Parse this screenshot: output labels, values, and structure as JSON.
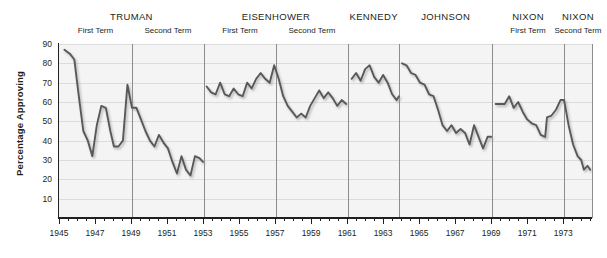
{
  "chart_data": {
    "type": "line",
    "title": "",
    "xlabel": "",
    "ylabel": "Percentage Approving",
    "ylim": [
      0,
      90
    ],
    "xlim": [
      1945,
      1974.6
    ],
    "grid": true,
    "legend": false,
    "ytick_labels": [
      "10",
      "20",
      "30",
      "40",
      "50",
      "60",
      "70",
      "80",
      "90"
    ],
    "ytick_values": [
      10,
      20,
      30,
      40,
      50,
      60,
      70,
      80,
      90
    ],
    "xtick_labels": [
      "1945",
      "1947",
      "1949",
      "1951",
      "1953",
      "1955",
      "1957",
      "1959",
      "1961",
      "1963",
      "1965",
      "1967",
      "1969",
      "1971",
      "1973"
    ],
    "xtick_values": [
      1945,
      1947,
      1949,
      1951,
      1953,
      1955,
      1957,
      1959,
      1961,
      1963,
      1965,
      1967,
      1969,
      1971,
      1973
    ],
    "presidents": [
      {
        "name": "TRUMAN",
        "start": 1945.0,
        "end": 1953.05,
        "terms": [
          {
            "label": "First Term",
            "start": 1945.0,
            "end": 1949.05
          },
          {
            "label": "Second Term",
            "start": 1949.05,
            "end": 1953.05
          }
        ]
      },
      {
        "name": "EISENHOWER",
        "start": 1953.05,
        "end": 1961.05,
        "terms": [
          {
            "label": "First Term",
            "start": 1953.05,
            "end": 1957.05
          },
          {
            "label": "Second Term",
            "start": 1957.05,
            "end": 1961.05
          }
        ]
      },
      {
        "name": "KENNEDY",
        "start": 1961.05,
        "end": 1963.9,
        "terms": []
      },
      {
        "name": "JOHNSON",
        "start": 1963.9,
        "end": 1969.05,
        "terms": []
      },
      {
        "name": "NIXON",
        "start": 1969.05,
        "end": 1973.05,
        "terms": [
          {
            "label": "First Term",
            "start": 1969.05,
            "end": 1973.05
          }
        ]
      },
      {
        "name": "NIXON",
        "start": 1973.05,
        "end": 1974.6,
        "terms": [
          {
            "label": "Second Term",
            "start": 1973.05,
            "end": 1974.6
          }
        ]
      }
    ],
    "term_dividers": [
      1949.05,
      1953.05,
      1957.05,
      1961.05,
      1963.9,
      1969.05,
      1973.05,
      1974.6
    ],
    "line_color": "#595959",
    "series": [
      {
        "name": "Truman",
        "points": [
          [
            1945.3,
            87
          ],
          [
            1945.6,
            85
          ],
          [
            1945.85,
            82
          ],
          [
            1946.1,
            63
          ],
          [
            1946.35,
            45
          ],
          [
            1946.6,
            40
          ],
          [
            1946.85,
            32
          ],
          [
            1947.1,
            48
          ],
          [
            1947.35,
            58
          ],
          [
            1947.6,
            57
          ],
          [
            1947.85,
            45
          ],
          [
            1948.05,
            37
          ],
          [
            1948.3,
            37
          ],
          [
            1948.55,
            40
          ],
          [
            1948.8,
            69
          ],
          [
            1949.05,
            57
          ],
          [
            1949.3,
            57
          ],
          [
            1949.55,
            51
          ],
          [
            1949.8,
            45
          ],
          [
            1950.05,
            40
          ],
          [
            1950.3,
            37
          ],
          [
            1950.55,
            43
          ],
          [
            1950.8,
            39
          ],
          [
            1951.05,
            36
          ],
          [
            1951.3,
            29
          ],
          [
            1951.55,
            23
          ],
          [
            1951.8,
            32
          ],
          [
            1952.05,
            25
          ],
          [
            1952.3,
            22
          ],
          [
            1952.55,
            32
          ],
          [
            1952.8,
            31
          ],
          [
            1953.0,
            29
          ]
        ]
      },
      {
        "name": "Eisenhower",
        "points": [
          [
            1953.2,
            68
          ],
          [
            1953.45,
            65
          ],
          [
            1953.7,
            64
          ],
          [
            1953.95,
            70
          ],
          [
            1954.2,
            64
          ],
          [
            1954.45,
            63
          ],
          [
            1954.7,
            67
          ],
          [
            1954.95,
            64
          ],
          [
            1955.2,
            63
          ],
          [
            1955.45,
            70
          ],
          [
            1955.7,
            67
          ],
          [
            1955.95,
            72
          ],
          [
            1956.2,
            75
          ],
          [
            1956.45,
            72
          ],
          [
            1956.7,
            70
          ],
          [
            1956.95,
            79
          ],
          [
            1957.2,
            72
          ],
          [
            1957.45,
            63
          ],
          [
            1957.7,
            58
          ],
          [
            1957.95,
            55
          ],
          [
            1958.2,
            52
          ],
          [
            1958.45,
            54
          ],
          [
            1958.7,
            52
          ],
          [
            1958.95,
            58
          ],
          [
            1959.2,
            62
          ],
          [
            1959.45,
            66
          ],
          [
            1959.7,
            62
          ],
          [
            1959.95,
            65
          ],
          [
            1960.2,
            62
          ],
          [
            1960.45,
            58
          ],
          [
            1960.7,
            61
          ],
          [
            1960.95,
            59
          ]
        ]
      },
      {
        "name": "Kennedy",
        "points": [
          [
            1961.25,
            72
          ],
          [
            1961.5,
            75
          ],
          [
            1961.75,
            71
          ],
          [
            1962.0,
            77
          ],
          [
            1962.25,
            79
          ],
          [
            1962.5,
            73
          ],
          [
            1962.75,
            70
          ],
          [
            1963.0,
            74
          ],
          [
            1963.25,
            70
          ],
          [
            1963.5,
            64
          ],
          [
            1963.75,
            61
          ],
          [
            1963.88,
            63
          ]
        ]
      },
      {
        "name": "Johnson",
        "points": [
          [
            1964.05,
            80
          ],
          [
            1964.3,
            79
          ],
          [
            1964.55,
            75
          ],
          [
            1964.8,
            74
          ],
          [
            1965.05,
            70
          ],
          [
            1965.3,
            69
          ],
          [
            1965.55,
            64
          ],
          [
            1965.8,
            63
          ],
          [
            1966.05,
            56
          ],
          [
            1966.3,
            48
          ],
          [
            1966.55,
            45
          ],
          [
            1966.8,
            48
          ],
          [
            1967.05,
            44
          ],
          [
            1967.3,
            46
          ],
          [
            1967.55,
            44
          ],
          [
            1967.8,
            38
          ],
          [
            1968.05,
            48
          ],
          [
            1968.3,
            42
          ],
          [
            1968.55,
            36
          ],
          [
            1968.8,
            42
          ],
          [
            1969.0,
            42
          ]
        ]
      },
      {
        "name": "Nixon first term",
        "points": [
          [
            1969.25,
            59
          ],
          [
            1969.5,
            59
          ],
          [
            1969.75,
            59
          ],
          [
            1970.0,
            63
          ],
          [
            1970.25,
            57
          ],
          [
            1970.5,
            60
          ],
          [
            1970.75,
            55
          ],
          [
            1971.0,
            51
          ],
          [
            1971.25,
            49
          ],
          [
            1971.5,
            48
          ],
          [
            1971.75,
            43
          ],
          [
            1972.0,
            42
          ],
          [
            1972.1,
            52
          ],
          [
            1972.35,
            53
          ],
          [
            1972.6,
            56
          ],
          [
            1972.85,
            61
          ],
          [
            1973.0,
            61
          ]
        ]
      },
      {
        "name": "Nixon second term",
        "points": [
          [
            1973.05,
            61
          ],
          [
            1973.3,
            48
          ],
          [
            1973.55,
            38
          ],
          [
            1973.8,
            32
          ],
          [
            1974.0,
            30
          ],
          [
            1974.15,
            25
          ],
          [
            1974.35,
            27
          ],
          [
            1974.5,
            25
          ]
        ]
      }
    ]
  }
}
